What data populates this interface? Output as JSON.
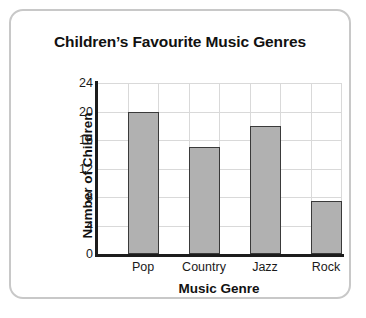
{
  "card": {
    "background": "#ffffff",
    "border_color": "#c8c8c8"
  },
  "chart_data": {
    "type": "bar",
    "title": "Children’s Favourite Music Genres",
    "xlabel": "Music Genre",
    "ylabel": "Number of Children",
    "categories": [
      "Pop",
      "Country",
      "Jazz",
      "Rock"
    ],
    "values": [
      20,
      15,
      18,
      7.5
    ],
    "yticks": [
      0,
      4,
      8,
      12,
      16,
      20,
      24
    ],
    "ylim": [
      0,
      24
    ],
    "grid": true,
    "legend": "none",
    "bar_color": "#b1b1b1",
    "bar_border_color": "#3a3a3a",
    "grid_color": "#d9d9d9",
    "axis_color": "#1c1c1c"
  }
}
